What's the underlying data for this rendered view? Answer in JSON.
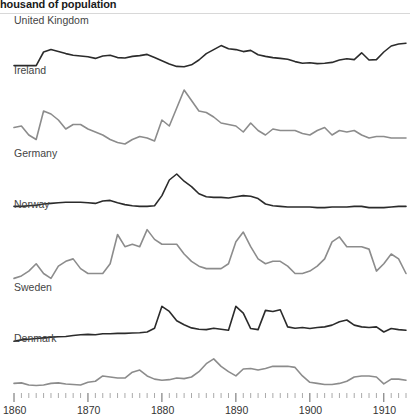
{
  "chart_data": {
    "type": "line",
    "title": "housand of population",
    "xlabel": "",
    "ylabel": "",
    "xlim": [
      1860,
      1913
    ],
    "grid": false,
    "legend": "panel-labels",
    "layout": "small-multiples",
    "x_ticks_major": [
      1860,
      1870,
      1880,
      1890,
      1900,
      1910
    ],
    "x_tick_labels": [
      "1860",
      "1870",
      "1880",
      "1890",
      "1900",
      "1910"
    ],
    "x_minor_tick_step": 1,
    "x": [
      1860,
      1861,
      1862,
      1863,
      1864,
      1865,
      1866,
      1867,
      1868,
      1869,
      1870,
      1871,
      1872,
      1873,
      1874,
      1875,
      1876,
      1877,
      1878,
      1879,
      1880,
      1881,
      1882,
      1883,
      1884,
      1885,
      1886,
      1887,
      1888,
      1889,
      1890,
      1891,
      1892,
      1893,
      1894,
      1895,
      1896,
      1897,
      1898,
      1899,
      1900,
      1901,
      1902,
      1903,
      1904,
      1905,
      1906,
      1907,
      1908,
      1909,
      1910,
      1911,
      1912,
      1913
    ],
    "series": [
      {
        "name": "United Kingdom",
        "color": "#2b2b2b",
        "ymax": 12,
        "values": [
          2.6,
          2.6,
          2.6,
          2.6,
          6.0,
          6.6,
          6.1,
          5.6,
          5.2,
          5.0,
          4.8,
          4.4,
          5.0,
          5.2,
          4.6,
          4.5,
          4.9,
          5.1,
          5.4,
          4.6,
          3.8,
          3.0,
          2.4,
          2.3,
          2.8,
          4.0,
          5.6,
          6.6,
          7.6,
          6.8,
          6.6,
          6.1,
          6.4,
          5.3,
          4.9,
          4.6,
          4.4,
          4.2,
          3.6,
          3.2,
          3.3,
          3.1,
          3.2,
          3.4,
          4.0,
          4.3,
          4.1,
          5.8,
          4.0,
          4.1,
          6.0,
          7.5,
          8.0,
          8.2
        ]
      },
      {
        "name": "Ireland",
        "color": "#8c8c8c",
        "ymax": 26,
        "values": [
          10.5,
          11.0,
          8.0,
          6.5,
          16.0,
          15.0,
          13.0,
          10.0,
          11.5,
          11.5,
          10.0,
          9.0,
          8.0,
          6.5,
          5.5,
          5.0,
          6.5,
          7.5,
          7.0,
          6.0,
          13.0,
          11.0,
          17.0,
          23.0,
          19.5,
          16.0,
          15.5,
          14.0,
          12.0,
          11.5,
          11.0,
          9.0,
          12.0,
          9.5,
          8.0,
          10.0,
          9.5,
          9.5,
          9.5,
          8.5,
          8.0,
          9.5,
          10.5,
          8.0,
          9.5,
          9.0,
          9.5,
          8.0,
          7.0,
          7.5,
          7.5,
          7.0,
          7.0,
          7.0
        ]
      },
      {
        "name": "Germany",
        "color": "#2b2b2b",
        "ymax": 8,
        "values": [
          0.6,
          0.6,
          0.7,
          0.8,
          1.0,
          1.1,
          1.2,
          1.3,
          1.3,
          1.3,
          1.2,
          1.1,
          1.5,
          1.6,
          1.2,
          0.9,
          0.7,
          0.6,
          0.6,
          0.7,
          2.4,
          5.0,
          6.0,
          4.8,
          3.9,
          2.7,
          2.2,
          2.1,
          2.1,
          2.0,
          2.2,
          2.4,
          2.3,
          1.9,
          1.0,
          0.7,
          0.6,
          0.5,
          0.5,
          0.5,
          0.5,
          0.4,
          0.4,
          0.5,
          0.5,
          0.5,
          0.6,
          0.6,
          0.4,
          0.4,
          0.4,
          0.5,
          0.6,
          0.6
        ]
      },
      {
        "name": "Norway",
        "color": "#8c8c8c",
        "ymax": 16,
        "values": [
          3.0,
          3.5,
          4.5,
          6.0,
          4.0,
          3.0,
          5.5,
          6.5,
          7.0,
          5.0,
          4.0,
          4.0,
          4.0,
          6.0,
          12.0,
          9.5,
          10.0,
          9.5,
          13.0,
          11.0,
          10.0,
          10.0,
          10.0,
          8.0,
          6.5,
          5.5,
          5.0,
          5.0,
          5.0,
          6.0,
          10.5,
          12.5,
          9.5,
          7.0,
          6.0,
          6.5,
          6.5,
          5.5,
          4.0,
          4.0,
          4.5,
          5.5,
          7.0,
          10.5,
          11.5,
          9.5,
          9.5,
          9.5,
          9.0,
          4.5,
          6.0,
          8.0,
          7.0,
          4.0
        ]
      },
      {
        "name": "Sweden",
        "color": "#2b2b2b",
        "ymax": 14,
        "values": [
          0.8,
          1.2,
          1.4,
          1.6,
          1.8,
          2.0,
          2.1,
          2.2,
          2.5,
          2.7,
          2.8,
          2.7,
          3.0,
          3.0,
          3.1,
          3.1,
          3.2,
          3.3,
          3.5,
          4.6,
          11.0,
          9.5,
          6.8,
          5.6,
          4.7,
          4.3,
          4.2,
          4.6,
          4.3,
          4.0,
          11.0,
          9.0,
          4.5,
          4.2,
          9.8,
          9.5,
          10.0,
          5.0,
          4.6,
          4.8,
          4.5,
          4.8,
          5.0,
          5.5,
          6.5,
          7.0,
          5.5,
          5.0,
          4.8,
          5.0,
          3.5,
          4.5,
          4.2,
          4.0
        ]
      },
      {
        "name": "Denmark",
        "color": "#8c8c8c",
        "ymax": 9,
        "values": [
          1.8,
          1.9,
          1.5,
          1.4,
          1.5,
          1.8,
          1.9,
          1.7,
          1.6,
          1.5,
          2.0,
          2.2,
          3.2,
          3.0,
          2.8,
          2.8,
          3.9,
          4.3,
          3.2,
          2.6,
          2.4,
          2.5,
          2.8,
          2.7,
          3.0,
          4.0,
          5.5,
          6.4,
          5.0,
          4.0,
          3.2,
          4.5,
          4.6,
          4.3,
          4.6,
          5.0,
          5.0,
          5.0,
          4.8,
          3.2,
          2.0,
          1.8,
          1.6,
          1.6,
          1.8,
          2.2,
          3.0,
          3.2,
          3.2,
          3.0,
          1.7,
          2.6,
          2.6,
          2.4
        ]
      }
    ]
  }
}
